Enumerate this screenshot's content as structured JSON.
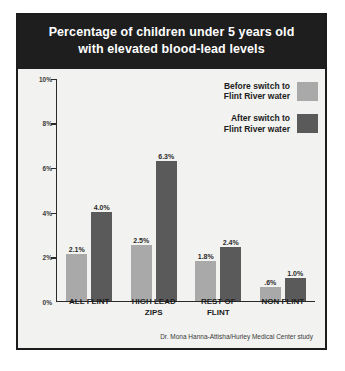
{
  "title": {
    "line1": "Percentage of children under 5 years old",
    "line2": "with elevated blood-lead levels"
  },
  "legend": {
    "position": "top-right",
    "items": [
      {
        "label": "Before switch to\nFlint River water",
        "color": "#a9a9a9"
      },
      {
        "label": "After switch to\nFlint River water",
        "color": "#5a5a5a"
      }
    ]
  },
  "source": "Dr. Mona Hanna-Attisha/Hurley Medical Center study",
  "axis": {
    "y_ticks": [
      "0%",
      "2%",
      "4%",
      "6%",
      "8%",
      "10%"
    ]
  },
  "chart_data": {
    "type": "bar",
    "title": "Percentage of children under 5 years old with elevated blood-lead levels",
    "subtitle": "",
    "xlabel": "",
    "ylabel": "",
    "ylim": [
      0,
      10
    ],
    "ytick_values": [
      0,
      2,
      4,
      6,
      8,
      10
    ],
    "ytick_labels": [
      "0%",
      "2%",
      "4%",
      "6%",
      "8%",
      "10%"
    ],
    "grid": false,
    "legend_position": "top-right",
    "categories": [
      "ALL FLINT",
      "HIGH LEAD\nZIPS",
      "REST OF\nFLINT",
      "NON FLINT"
    ],
    "series": [
      {
        "name": "Before switch to Flint River water",
        "color": "#a9a9a9",
        "values": [
          2.1,
          2.5,
          1.8,
          0.6
        ],
        "labels": [
          "2.1%",
          "2.5%",
          "1.8%",
          ".6%"
        ]
      },
      {
        "name": "After switch to Flint River water",
        "color": "#5a5a5a",
        "values": [
          4.0,
          6.3,
          2.4,
          1.0
        ],
        "labels": [
          "4.0%",
          "6.3%",
          "2.4%",
          "1.0%"
        ]
      }
    ],
    "annotations": [
      "Dr. Mona Hanna-Attisha/Hurley Medical Center study"
    ]
  }
}
